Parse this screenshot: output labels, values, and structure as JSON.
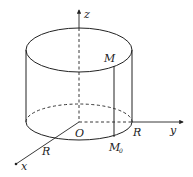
{
  "diagram": {
    "type": "cylinder-coordinate-figure",
    "axes": {
      "x": {
        "label": "x"
      },
      "y": {
        "label": "y"
      },
      "z": {
        "label": "z"
      }
    },
    "points": {
      "origin": {
        "label": "O"
      },
      "M": {
        "label": "M"
      },
      "M0": {
        "label": "M",
        "subscript": "0"
      }
    },
    "radius_labels": {
      "on_x_axis": "R",
      "on_y_axis": "R"
    },
    "colors": {
      "stroke": "#222222",
      "background": "#ffffff"
    }
  }
}
